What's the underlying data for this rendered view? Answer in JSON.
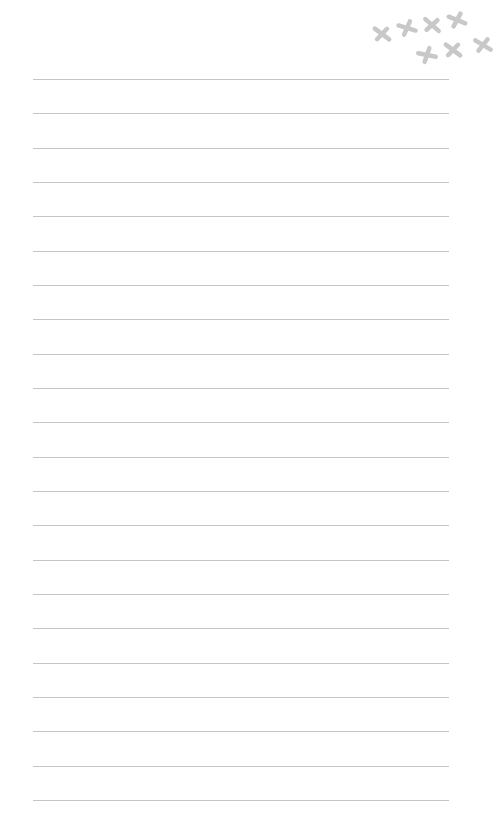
{
  "paper": {
    "background": "#ffffff",
    "line_color": "#c4c4c4",
    "line_count": 22,
    "first_line_y": 79,
    "line_spacing": 34.33,
    "line_left": 33,
    "line_right": 449
  },
  "decoration": {
    "icon": "x-mark-icon",
    "color": "#c8c8c8",
    "marks": [
      {
        "x": 382,
        "y": 34,
        "rot": 10
      },
      {
        "x": 407,
        "y": 28,
        "rot": -10
      },
      {
        "x": 432,
        "y": 25,
        "rot": 15
      },
      {
        "x": 457,
        "y": 20,
        "rot": -5
      },
      {
        "x": 427,
        "y": 55,
        "rot": -15
      },
      {
        "x": 453,
        "y": 50,
        "rot": 10
      },
      {
        "x": 483,
        "y": 45,
        "rot": 5
      }
    ]
  }
}
